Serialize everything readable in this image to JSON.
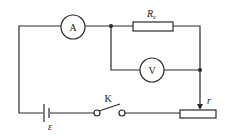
{
  "diagram": {
    "type": "circuit",
    "ammeter": {
      "label": "A"
    },
    "voltmeter": {
      "label": "V"
    },
    "resistor": {
      "label": "R",
      "subscript": "x"
    },
    "switch": {
      "label": "K"
    },
    "battery": {
      "label": "ε"
    },
    "rheostat": {
      "label": "r"
    }
  }
}
